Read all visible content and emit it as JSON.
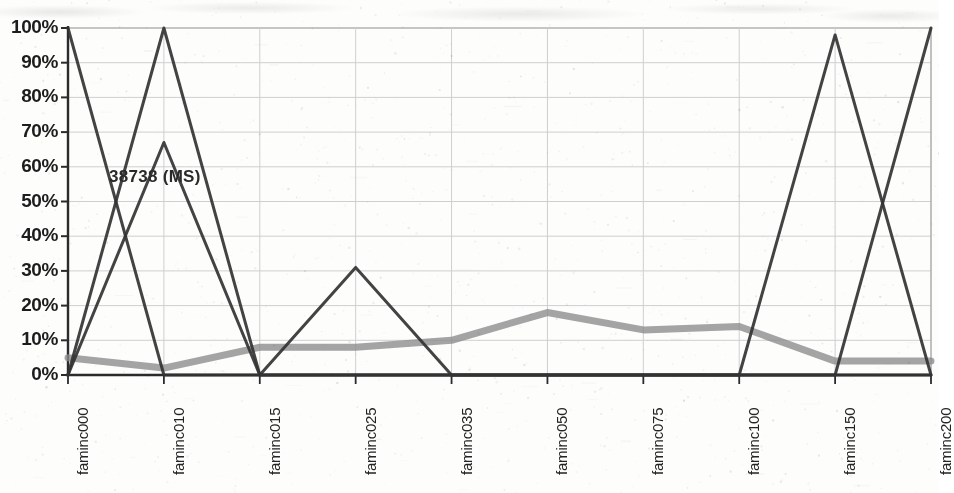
{
  "chart_data": {
    "type": "line",
    "title": "",
    "subtitle": "",
    "xlabel": "",
    "ylabel": "",
    "grid": true,
    "legend_position": "none",
    "categories": [
      "faminc000",
      "faminc010",
      "faminc015",
      "faminc025",
      "faminc035",
      "faminc050",
      "faminc075",
      "faminc100",
      "faminc150",
      "faminc200"
    ],
    "ytick_labels": [
      "100%",
      "90%",
      "80%",
      "70%",
      "60%",
      "50%",
      "40%",
      "30%",
      "20%",
      "10%",
      "0%"
    ],
    "ytick_values": [
      100,
      90,
      80,
      70,
      60,
      50,
      40,
      30,
      20,
      10,
      0
    ],
    "ylim": [
      0,
      100
    ],
    "series": [
      {
        "name": "thick-gray-series",
        "color": "#8a8a8a",
        "style": "thick",
        "values": [
          5,
          2,
          8,
          8,
          10,
          18,
          13,
          14,
          4,
          4
        ]
      },
      {
        "name": "dark-series-a",
        "color": "#333333",
        "style": "thin",
        "values": [
          100,
          0,
          0,
          31,
          0,
          0,
          0,
          0,
          98,
          0
        ]
      },
      {
        "name": "dark-series-b",
        "color": "#333333",
        "style": "thin",
        "values": [
          0,
          100,
          0,
          0,
          0,
          0,
          0,
          0,
          0,
          100
        ]
      },
      {
        "name": "dark-series-c",
        "color": "#333333",
        "style": "thin",
        "values": [
          0,
          67,
          0,
          0,
          0,
          0,
          0,
          0,
          0,
          0
        ]
      }
    ],
    "annotations": [
      {
        "text": "38738 (MS)",
        "x_category": "faminc010",
        "y_value": 57
      }
    ]
  },
  "axis": {
    "y_axis_name": "percent-axis",
    "x_axis_name": "faminc-category-axis"
  },
  "colors": {
    "gridline": "#cfcfcf",
    "axis": "#2b2b2b",
    "series_gray": "#8a8a8a",
    "series_dark": "#333333",
    "background": "#ffffff",
    "text": "#1d1d1d"
  }
}
